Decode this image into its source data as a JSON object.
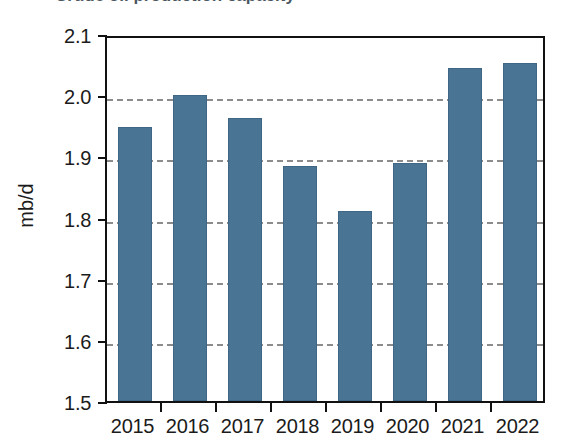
{
  "title_remnant": {
    "text": "Crude oil production capacity"
  },
  "chart_data": {
    "type": "bar",
    "title": "",
    "xlabel": "",
    "ylabel": "mb/d",
    "ylim": [
      1.5,
      2.1
    ],
    "ytick_step": 0.1,
    "yticks": [
      "1.5",
      "1.6",
      "1.7",
      "1.8",
      "1.9",
      "2.0",
      "2.1"
    ],
    "ytick_values": [
      1.5,
      1.6,
      1.7,
      1.8,
      1.9,
      2.0,
      2.1
    ],
    "gridlines": [
      1.6,
      1.7,
      1.8,
      1.9,
      2.0
    ],
    "grid": true,
    "grid_style": "dashed",
    "grid_color": "#8c8c8c",
    "legend": "none",
    "bar_color": "#4a7494",
    "categories": [
      "2015",
      "2016",
      "2017",
      "2018",
      "2019",
      "2020",
      "2021",
      "2022"
    ],
    "values": [
      1.948,
      2.0,
      1.963,
      1.884,
      1.811,
      1.889,
      2.045,
      2.053
    ]
  }
}
